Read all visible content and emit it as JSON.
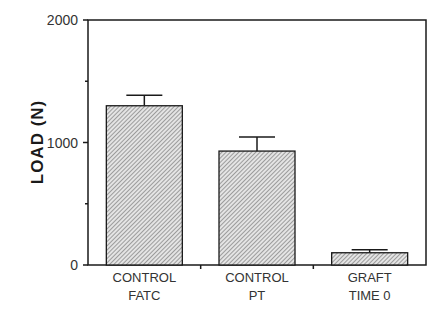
{
  "chart_data": {
    "type": "bar",
    "title": "",
    "xlabel": "",
    "ylabel": "LOAD (N)",
    "ylim": [
      0,
      2000
    ],
    "yticks": [
      0,
      1000,
      2000
    ],
    "minor_yticks": [
      500,
      1500
    ],
    "grid": false,
    "legend": null,
    "categories": [
      "CONTROL FATC",
      "CONTROL PT",
      "GRAFT TIME 0"
    ],
    "category_lines": [
      [
        "CONTROL",
        "FATC"
      ],
      [
        "CONTROL",
        "PT"
      ],
      [
        "GRAFT",
        "TIME 0"
      ]
    ],
    "values": [
      1300,
      930,
      100
    ],
    "error_upper": [
      1385,
      1045,
      125
    ],
    "bar_fill": "hatched",
    "colors": {
      "axis": "#1a1a1a",
      "bar_fill": "#d9d9d9",
      "hatch": "#555555"
    }
  }
}
